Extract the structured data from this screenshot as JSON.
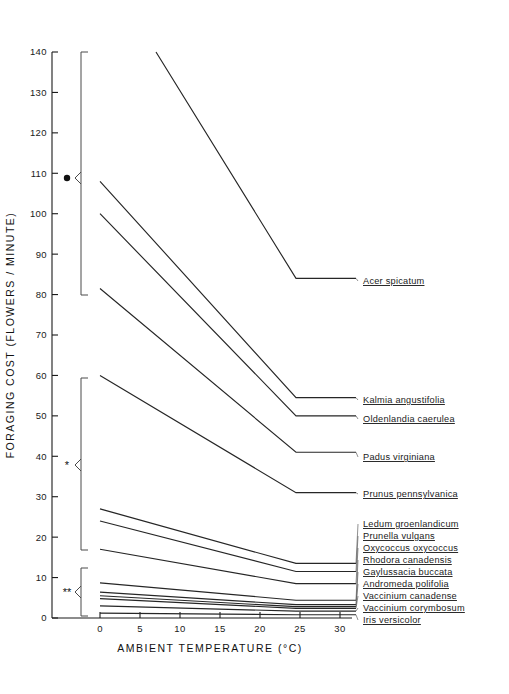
{
  "figure": {
    "background": "#ffffff",
    "line_color": "#262626",
    "axis_color": "#1a1a1a"
  },
  "chart_data": {
    "type": "line",
    "title": "",
    "xlabel": "AMBIENT  TEMPERATURE  (°C)",
    "ylabel": "FORAGING  COST  (FLOWERS / MINUTE)",
    "xlim": [
      0,
      32
    ],
    "ylim": [
      0,
      140
    ],
    "xticks": [
      0,
      5,
      10,
      15,
      20,
      25,
      30
    ],
    "xtick_labels": [
      "0",
      "5",
      "10",
      "15",
      "20",
      "25",
      "30"
    ],
    "yticks": [
      0,
      10,
      20,
      30,
      40,
      50,
      60,
      70,
      80,
      90,
      100,
      110,
      120,
      130,
      140
    ],
    "ytick_labels": [
      "0",
      "10",
      "20",
      "30",
      "40",
      "50",
      "60",
      "70",
      "80",
      "90",
      "100",
      "110",
      "120",
      "130",
      "140"
    ],
    "grid": false,
    "legend_position": "right-inline-labels",
    "breakpoint_x": 24.5,
    "series": [
      {
        "name": "Acer spicatum",
        "x": [
          7,
          24.5,
          32
        ],
        "y": [
          140,
          84,
          84
        ],
        "group": "dot"
      },
      {
        "name": "Kalmia angustifolia",
        "x": [
          0,
          24.5,
          32
        ],
        "y": [
          108,
          54.5,
          54.5
        ],
        "group": "dot"
      },
      {
        "name": "Oldenlandia caerulea",
        "x": [
          0,
          24.5,
          32
        ],
        "y": [
          100,
          50,
          50
        ],
        "group": "dot"
      },
      {
        "name": "Padus virginiana",
        "x": [
          0,
          24.5,
          32
        ],
        "y": [
          81.5,
          41,
          41
        ],
        "group": "dot"
      },
      {
        "name": "Prunus pennsylvanica",
        "x": [
          0,
          24.5,
          32
        ],
        "y": [
          60,
          31,
          31
        ],
        "group": "star1"
      },
      {
        "name": "Ledum groenlandicum",
        "x": [
          0,
          24.5,
          32
        ],
        "y": [
          27,
          13.5,
          13.5
        ],
        "group": "star1"
      },
      {
        "name": "Prunella vulgans",
        "x": [
          0,
          24.5,
          32
        ],
        "y": [
          24,
          11.5,
          11.5
        ],
        "group": "star1"
      },
      {
        "name": "Oxycoccus oxycoccus",
        "x": [
          0,
          24.5,
          32
        ],
        "y": [
          17,
          8.5,
          8.5
        ],
        "group": "star1"
      },
      {
        "name": "Rhodora canadensis",
        "x": [
          0,
          24.5,
          32
        ],
        "y": [
          8.7,
          4.4,
          4.4
        ],
        "group": "star2"
      },
      {
        "name": "Gaylussacia buccata",
        "x": [
          0,
          24.5,
          32
        ],
        "y": [
          6.4,
          3.3,
          3.3
        ],
        "group": "star2"
      },
      {
        "name": "Andromeda polifolia",
        "x": [
          0,
          24.5,
          32
        ],
        "y": [
          5.5,
          2.8,
          2.8
        ],
        "group": "star2"
      },
      {
        "name": "Vaccinium canadense",
        "x": [
          0,
          24.5,
          32
        ],
        "y": [
          4.8,
          2.4,
          2.4
        ],
        "group": "star2"
      },
      {
        "name": "Vaccinium corymbosum",
        "x": [
          0,
          24.5,
          32
        ],
        "y": [
          3.0,
          1.7,
          1.7
        ],
        "group": "star2"
      },
      {
        "name": "Iris versicolor",
        "x": [
          0,
          24.5,
          32
        ],
        "y": [
          1.2,
          0.8,
          0.8
        ],
        "group": "star2"
      }
    ],
    "labels": [
      {
        "text": "Acer  spicatum",
        "y_px": 281
      },
      {
        "text": "Kalmia  angustifolia",
        "y_px": 400
      },
      {
        "text": "Oldenlandia  caerulea",
        "y_px": 419
      },
      {
        "text": "Padus  virginiana",
        "y_px": 457
      },
      {
        "text": "Prunus  pennsylvanica",
        "y_px": 494
      },
      {
        "text": "Ledum  groenlandicum",
        "y_px": 524
      },
      {
        "text": "Prunella  vulgans",
        "y_px": 536
      },
      {
        "text": "Oxycoccus  oxycoccus",
        "y_px": 548
      },
      {
        "text": "Rhodora  canadensis",
        "y_px": 560
      },
      {
        "text": "Gaylussacia  buccata",
        "y_px": 572
      },
      {
        "text": "Andromeda  polifolia",
        "y_px": 584
      },
      {
        "text": "Vaccinium  canadense",
        "y_px": 596
      },
      {
        "text": "Vaccinium  corymbosum",
        "y_px": 608
      },
      {
        "text": "Iris  versicolor",
        "y_px": 620
      }
    ],
    "group_brackets": [
      {
        "marker": "●",
        "marker_name": "filled-circle",
        "y_top": 52,
        "y_bottom": 295,
        "y_point": 178
      },
      {
        "marker": "*",
        "marker_name": "single-asterisk",
        "y_top": 378,
        "y_bottom": 550,
        "y_point": 465
      },
      {
        "marker": "**",
        "marker_name": "double-asterisk",
        "y_top": 568,
        "y_bottom": 616,
        "y_point": 592
      }
    ]
  }
}
